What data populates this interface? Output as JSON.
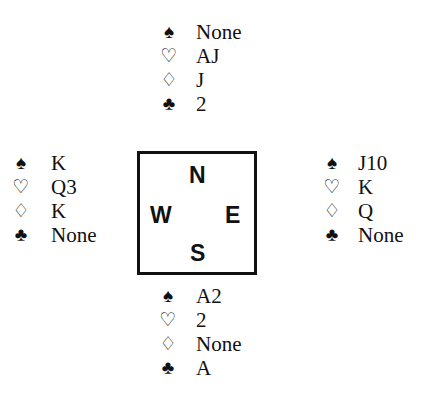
{
  "diagram": {
    "type": "bridge-deal",
    "suit_symbols": {
      "spades": "♠",
      "hearts": "♡",
      "diamonds": "♢",
      "clubs": "♣"
    },
    "compass": {
      "north": "N",
      "south": "S",
      "east": "E",
      "west": "W"
    },
    "hands": {
      "north": {
        "spades": "None",
        "hearts": "AJ",
        "diamonds": "J",
        "clubs": "2"
      },
      "west": {
        "spades": "K",
        "hearts": "Q3",
        "diamonds": "K",
        "clubs": "None"
      },
      "east": {
        "spades": "J10",
        "hearts": "K",
        "diamonds": "Q",
        "clubs": "None"
      },
      "south": {
        "spades": "A2",
        "hearts": "2",
        "diamonds": "None",
        "clubs": "A"
      }
    }
  }
}
